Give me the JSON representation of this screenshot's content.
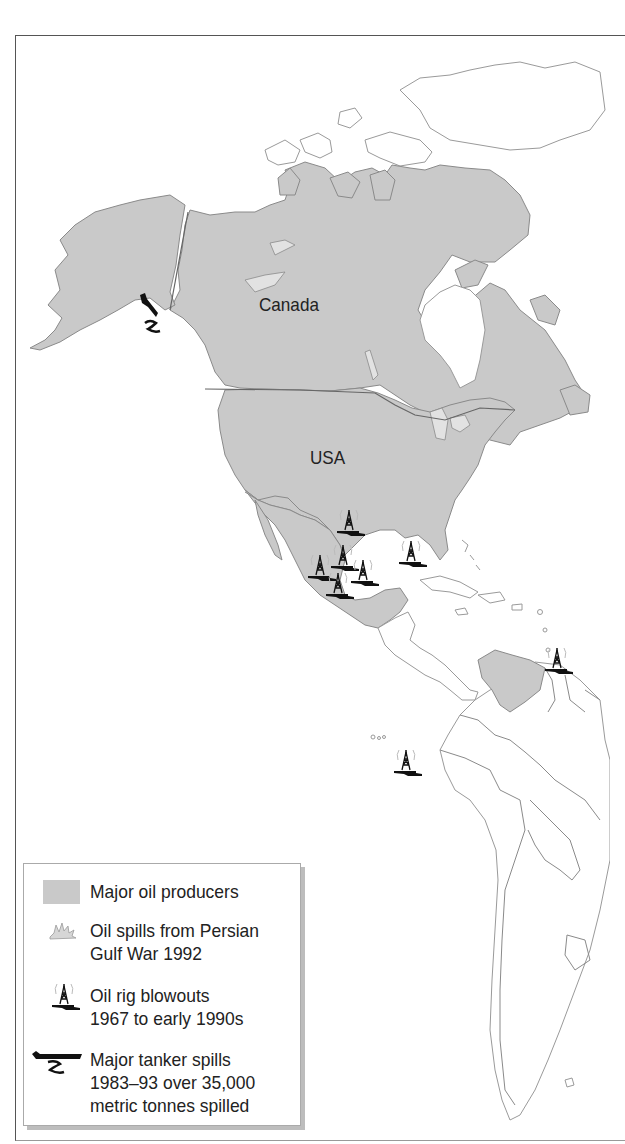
{
  "map": {
    "labels": {
      "canada": "Canada",
      "usa": "USA"
    },
    "colors": {
      "producer_fill": "#c9c9c9",
      "outline": "#8a8a8a",
      "background": "#ffffff",
      "icon": "#111111"
    },
    "major_oil_producers": [
      "Canada",
      "USA",
      "Mexico",
      "Venezuela"
    ],
    "oil_rig_blowouts": [
      {
        "x": 349,
        "y": 522
      },
      {
        "x": 343,
        "y": 557
      },
      {
        "x": 320,
        "y": 567
      },
      {
        "x": 363,
        "y": 572
      },
      {
        "x": 338,
        "y": 585
      },
      {
        "x": 411,
        "y": 553
      },
      {
        "x": 557,
        "y": 660
      },
      {
        "x": 406,
        "y": 762
      }
    ],
    "tanker_spills": [
      {
        "x": 150,
        "y": 315
      }
    ]
  },
  "legend": {
    "items": [
      {
        "icon": "producer-swatch",
        "label": "Major oil producers"
      },
      {
        "icon": "gulf-war-spill-icon",
        "label": "Oil spills from Persian\nGulf War 1992"
      },
      {
        "icon": "oil-rig-blowout-icon",
        "label": "Oil rig blowouts\n1967 to early 1990s"
      },
      {
        "icon": "tanker-spill-icon",
        "label": "Major tanker spills\n1983–93 over 35,000\nmetric tonnes spilled"
      }
    ]
  }
}
